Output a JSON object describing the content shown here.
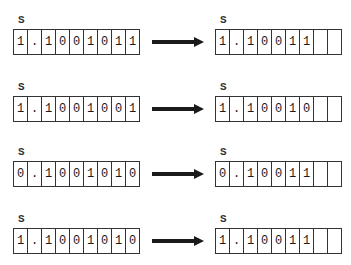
{
  "register_label": "S",
  "rows": [
    {
      "input": [
        "1",
        ".",
        "1",
        "0",
        "0",
        "1",
        "0",
        "1",
        "1"
      ],
      "output": [
        "1",
        ".",
        "1",
        "0",
        "0",
        "1",
        "1",
        "",
        ""
      ]
    },
    {
      "input": [
        "1",
        ".",
        "1",
        "0",
        "0",
        "1",
        "0",
        "0",
        "1"
      ],
      "output": [
        "1",
        ".",
        "1",
        "0",
        "0",
        "1",
        "0",
        "",
        ""
      ]
    },
    {
      "input": [
        "0",
        ".",
        "1",
        "0",
        "0",
        "1",
        "0",
        "1",
        "0"
      ],
      "output": [
        "0",
        ".",
        "1",
        "0",
        "0",
        "1",
        "1",
        "",
        ""
      ]
    },
    {
      "input": [
        "1",
        ".",
        "1",
        "0",
        "0",
        "1",
        "0",
        "1",
        "0"
      ],
      "output": [
        "1",
        ".",
        "1",
        "0",
        "0",
        "1",
        "1",
        "",
        ""
      ]
    }
  ],
  "arrow_icon": "right-arrow-icon"
}
